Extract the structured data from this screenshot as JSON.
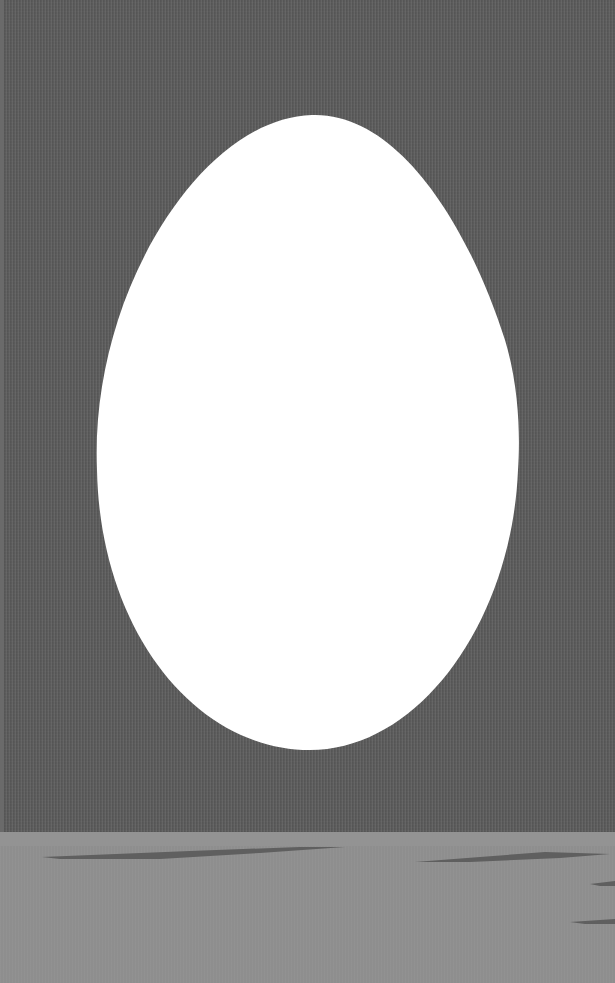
{
  "scene": {
    "title": "Egg illustration",
    "colors": {
      "sky": "#5a5a5a",
      "ground": "#8e8e8e",
      "egg": "#ffffff",
      "streak": "#5f5f5f"
    },
    "egg": {
      "center_x": 308,
      "top_y": 115,
      "bottom_y": 750,
      "left_x": 97,
      "right_x": 518
    },
    "horizon_y": 833,
    "streaks": [
      {
        "name": "streak-left-long",
        "x1": 42,
        "x2": 345,
        "y": 857
      },
      {
        "name": "streak-right",
        "x1": 415,
        "x2": 610,
        "y": 860
      },
      {
        "name": "streak-edge-1",
        "x1": 590,
        "x2": 615,
        "y": 884
      },
      {
        "name": "streak-edge-2",
        "x1": 570,
        "x2": 615,
        "y": 922
      }
    ]
  }
}
